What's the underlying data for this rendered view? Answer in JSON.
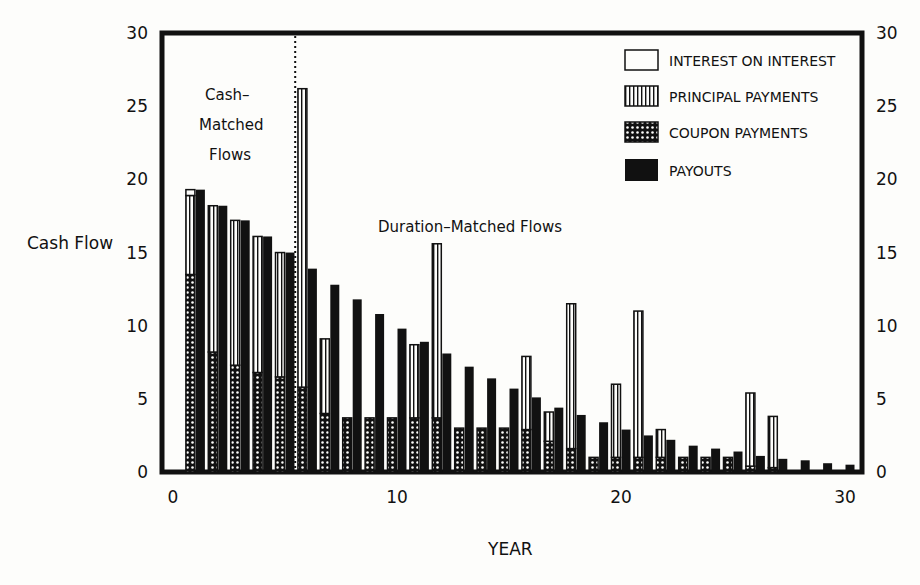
{
  "chart_data": {
    "type": "bar",
    "title": "",
    "xlabel": "YEAR",
    "ylabel": "Cash Flow",
    "xlim": [
      0,
      30
    ],
    "ylim": [
      0,
      30
    ],
    "x_ticks": [
      0,
      10,
      20,
      30
    ],
    "y_ticks": [
      0,
      5,
      10,
      15,
      20,
      25,
      30
    ],
    "y_ticks_right": [
      0,
      5,
      10,
      15,
      20,
      25,
      30
    ],
    "grid": false,
    "legend_position": "upper right (inside)",
    "legend": [
      {
        "key": "interest",
        "label": "INTEREST ON INTEREST",
        "pattern": "blank"
      },
      {
        "key": "principal",
        "label": "PRINCIPAL PAYMENTS",
        "pattern": "vertical-stripes"
      },
      {
        "key": "coupon",
        "label": "COUPON PAYMENTS",
        "pattern": "crosshatch"
      },
      {
        "key": "payouts",
        "label": "PAYOUTS",
        "pattern": "solid"
      }
    ],
    "annotations": [
      {
        "text": "Cash-\nMatched\nFlows",
        "x": 2.6,
        "y": 26
      },
      {
        "text": "Duration-Matched Flows",
        "x": 13.3,
        "y": 16.9
      }
    ],
    "divider_year": 5.5,
    "categories": [
      1,
      2,
      3,
      4,
      5,
      6,
      7,
      8,
      9,
      10,
      11,
      12,
      13,
      14,
      15,
      16,
      17,
      18,
      19,
      20,
      21,
      22,
      23,
      24,
      25,
      26,
      27,
      28,
      29,
      30
    ],
    "series": [
      {
        "name": "COUPON PAYMENTS",
        "values": [
          13.5,
          8.2,
          7.3,
          6.8,
          6.5,
          5.8,
          4.0,
          3.7,
          3.7,
          3.7,
          3.7,
          3.7,
          3.0,
          3.0,
          3.0,
          2.9,
          2.1,
          1.6,
          1.0,
          1.0,
          1.0,
          1.0,
          1.0,
          1.0,
          1.0,
          0.4,
          0.3,
          0,
          0,
          0
        ]
      },
      {
        "name": "PRINCIPAL PAYMENTS",
        "values": [
          5.4,
          10.0,
          9.9,
          9.3,
          8.5,
          20.4,
          5.1,
          0,
          0,
          0,
          5.0,
          11.9,
          0,
          0,
          0,
          5.0,
          2.0,
          9.9,
          0,
          5.0,
          10.0,
          1.9,
          0,
          0,
          0,
          5.0,
          3.5,
          0,
          0,
          0
        ]
      },
      {
        "name": "INTEREST ON INTEREST",
        "values": [
          0.4,
          0,
          0,
          0,
          0,
          0,
          0,
          0,
          0,
          0,
          0,
          0,
          0,
          0,
          0,
          0,
          0,
          0,
          0,
          0,
          0,
          0,
          0,
          0,
          0,
          0,
          0,
          0,
          0,
          0
        ]
      },
      {
        "name": "PAYOUTS",
        "values": [
          19.3,
          18.2,
          17.2,
          16.1,
          15.0,
          13.9,
          12.8,
          11.8,
          10.8,
          9.8,
          8.9,
          8.1,
          7.2,
          6.4,
          5.7,
          5.1,
          4.4,
          3.9,
          3.4,
          2.9,
          2.5,
          2.2,
          1.8,
          1.6,
          1.4,
          1.1,
          0.9,
          0.8,
          0.6,
          0.5
        ]
      }
    ]
  },
  "labels": {
    "ylabel": "Cash Flow",
    "xlabel": "YEAR",
    "cash_matched_1": "Cash–",
    "cash_matched_2": "Matched",
    "cash_matched_3": "Flows",
    "duration_matched": "Duration–Matched Flows",
    "legend_interest": "INTEREST ON INTEREST",
    "legend_principal": "PRINCIPAL PAYMENTS",
    "legend_coupon": "COUPON PAYMENTS",
    "legend_payouts": "PAYOUTS"
  },
  "colors": {
    "ink": "#111111",
    "paper": "#fdfdfb"
  }
}
